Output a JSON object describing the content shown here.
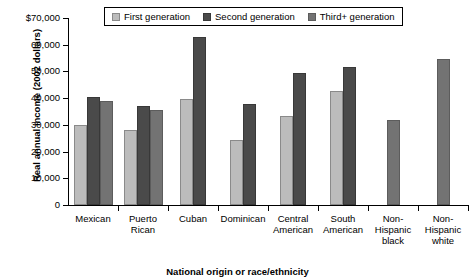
{
  "chart_data": {
    "type": "bar",
    "title": "",
    "xlabel": "National origin or race/ethnicity",
    "ylabel": "Real annual income (2002 dollars)",
    "ylim": [
      0,
      70000
    ],
    "grid": false,
    "legend_position": "top-center",
    "ytick_labels": [
      "$70,000",
      "60,000",
      "50,000",
      "40,000",
      "30,000",
      "20,000",
      "10,000",
      "0"
    ],
    "ytick_values": [
      70000,
      60000,
      50000,
      40000,
      30000,
      20000,
      10000,
      0
    ],
    "categories": [
      "Mexican",
      "Puerto Rican",
      "Cuban",
      "Dominican",
      "Central American",
      "South American",
      "Non-Hispanic black",
      "Non-Hispanic white"
    ],
    "category_lines": [
      [
        "Mexican"
      ],
      [
        "Puerto",
        "Rican"
      ],
      [
        "Cuban"
      ],
      [
        "Dominican"
      ],
      [
        "Central",
        "American"
      ],
      [
        "South",
        "American"
      ],
      [
        "Non-",
        "Hispanic",
        "black"
      ],
      [
        "Non-",
        "Hispanic",
        "white"
      ]
    ],
    "series": [
      {
        "name": "First generation",
        "color": "#bcbcbc",
        "values": [
          30000,
          28000,
          39800,
          24200,
          33500,
          42700,
          null,
          null
        ]
      },
      {
        "name": "Second generation",
        "color": "#4a4a4a",
        "values": [
          40500,
          37000,
          62800,
          38000,
          49300,
          51800,
          null,
          null
        ]
      },
      {
        "name": "Third+ generation",
        "color": "#737373",
        "values": [
          39000,
          35700,
          null,
          null,
          null,
          null,
          32000,
          54800
        ]
      }
    ]
  },
  "legend": {
    "items": [
      {
        "label": "First generation",
        "key": "gen1"
      },
      {
        "label": "Second generation",
        "key": "gen2"
      },
      {
        "label": "Third+ generation",
        "key": "gen3"
      }
    ]
  }
}
